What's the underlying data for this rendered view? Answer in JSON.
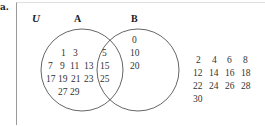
{
  "part_label": "a.",
  "universe_label": "U",
  "set_a": {
    "label": "A",
    "only_rows": [
      [
        "1",
        "3"
      ],
      [
        "7",
        "9",
        "11",
        "13"
      ],
      [
        "17",
        "19",
        "21",
        "23"
      ],
      [
        "27",
        "29"
      ]
    ]
  },
  "set_b": {
    "label": "B",
    "only": [
      "0",
      "10",
      "20"
    ]
  },
  "intersection": [
    "5",
    "15",
    "25"
  ],
  "outside_rows": [
    [
      "2",
      "4",
      "6",
      "8"
    ],
    [
      "12",
      "14",
      "16",
      "18"
    ],
    [
      "22",
      "24",
      "26",
      "28"
    ],
    [
      "30"
    ]
  ]
}
